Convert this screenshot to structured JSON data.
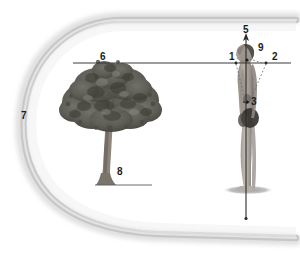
{
  "figure": {
    "background_color": "#ffffff",
    "width": 300,
    "height": 256
  },
  "callouts": [
    {
      "id": "1",
      "label": "1",
      "x": 229,
      "y": 52,
      "target": "left-horizon-point"
    },
    {
      "id": "2",
      "label": "2",
      "x": 272,
      "y": 52,
      "target": "right-horizon-point"
    },
    {
      "id": "3",
      "label": "3",
      "x": 252,
      "y": 103,
      "target": "torso-center-point"
    },
    {
      "id": "5",
      "label": "5",
      "x": 245,
      "y": 27,
      "target": "vertical-axis-arrow"
    },
    {
      "id": "6",
      "label": "6",
      "x": 101,
      "y": 52,
      "target": "horizon-line"
    },
    {
      "id": "7",
      "label": "7",
      "x": 22,
      "y": 112,
      "target": "field-of-view-boundary"
    },
    {
      "id": "8",
      "label": "8",
      "x": 119,
      "y": 169,
      "target": "ground-line"
    },
    {
      "id": "9",
      "label": "9",
      "x": 259,
      "y": 45,
      "target": "head-point"
    }
  ],
  "graphics": {
    "field_shape": {
      "name": "field-of-view-blob",
      "stroke_color": "#bdbdbd",
      "fill_color": "#ffffff",
      "stroke_width": 7
    },
    "horizon_line": {
      "name": "horizon-line",
      "color": "#3a3a3a",
      "y": 63,
      "x_start": 73,
      "x_end": 291
    },
    "vertical_axis": {
      "name": "vertical-axis",
      "color": "#2a2a2a",
      "x": 246,
      "y_top": 36,
      "y_bottom": 219
    },
    "ground_line": {
      "name": "ground-line",
      "color": "#555555",
      "y": 185,
      "x_start": 95,
      "x_end": 152
    },
    "sight_lines": {
      "name": "dotted-sight-lines",
      "color": "#6a6a6a",
      "style": "dotted"
    },
    "tree": {
      "name": "tree-illustration",
      "canopy_color": "#5a5a52",
      "trunk_color": "#8a8279"
    },
    "human_figure": {
      "name": "human-figure-illustration",
      "skin_color": "#a9a39c",
      "shade_color": "#3f3c39",
      "base_ellipse_color": "#b8b8b8"
    }
  }
}
